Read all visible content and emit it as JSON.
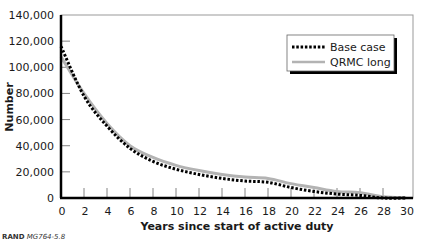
{
  "chart_data": {
    "type": "line",
    "title": "",
    "xlabel": "Years since start of active duty",
    "ylabel": "Number",
    "xlim": [
      0,
      30
    ],
    "ylim": [
      0,
      140000
    ],
    "x_ticks": [
      "0",
      "2",
      "4",
      "6",
      "8",
      "10",
      "12",
      "14",
      "16",
      "18",
      "20",
      "22",
      "24",
      "26",
      "28",
      "30"
    ],
    "y_ticks": [
      "0",
      "20,000",
      "40,000",
      "60,000",
      "80,000",
      "100,000",
      "120,000",
      "140,000"
    ],
    "grid": false,
    "legend_position": "upper right",
    "x": [
      0,
      2,
      4,
      6,
      8,
      10,
      12,
      14,
      16,
      18,
      20,
      22,
      24,
      26,
      28,
      30
    ],
    "series": [
      {
        "name": "Base case",
        "style": "dotted",
        "color": "#000000",
        "values": [
          116000,
          78000,
          55000,
          38000,
          28000,
          22000,
          18000,
          15000,
          13000,
          12000,
          8000,
          5000,
          3000,
          2000,
          0,
          0
        ]
      },
      {
        "name": "QRMC long",
        "style": "solid",
        "color": "#b3b3b3",
        "values": [
          108000,
          80000,
          57000,
          40000,
          31000,
          25000,
          21000,
          18000,
          16000,
          15000,
          11000,
          8000,
          5000,
          4000,
          1000,
          0
        ]
      }
    ]
  },
  "source_note": {
    "org": "RAND",
    "id": "MG764-5.8"
  }
}
